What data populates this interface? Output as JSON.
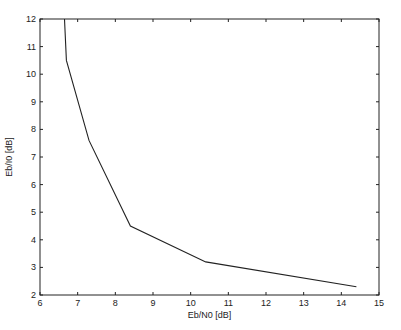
{
  "chart_data": {
    "type": "line",
    "title": "",
    "xlabel": "Eb/N0 [dB]",
    "ylabel": "Eb/I0 [dB]",
    "xlim": [
      6,
      15
    ],
    "ylim": [
      2,
      12
    ],
    "xticks": [
      6,
      7,
      8,
      9,
      10,
      11,
      12,
      13,
      14,
      15
    ],
    "yticks": [
      2,
      3,
      4,
      5,
      6,
      7,
      8,
      9,
      10,
      11,
      12
    ],
    "grid": false,
    "legend": null,
    "series": [
      {
        "name": "curve",
        "color": "#222222",
        "x": [
          6.65,
          6.7,
          7.3,
          8.4,
          10.4,
          14.4
        ],
        "y": [
          12,
          10.5,
          7.6,
          4.5,
          3.2,
          2.3
        ]
      }
    ]
  },
  "plot_area": {
    "left": 40,
    "top": 19,
    "right": 379,
    "bottom": 295
  }
}
